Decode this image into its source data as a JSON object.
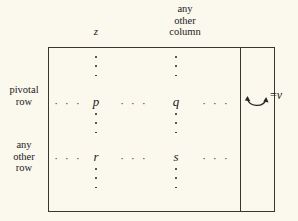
{
  "figure": {
    "background_color": "#fbf9ee",
    "ink_color": "#2a2722",
    "headers": {
      "pivot_column": "z",
      "other_column": "any\nother\ncolumn"
    },
    "row_labels": {
      "pivotal_row": "pivotal\nrow",
      "other_row": "any\nother\nrow"
    },
    "cells": {
      "pivot_row_pivot_col": "p",
      "pivot_row_other_col": "q",
      "other_row_pivot_col": "r",
      "other_row_other_col": "s"
    },
    "ellipsis": {
      "horizontal": "· · ·"
    },
    "rhs": {
      "equals": "=",
      "value": "v"
    }
  }
}
